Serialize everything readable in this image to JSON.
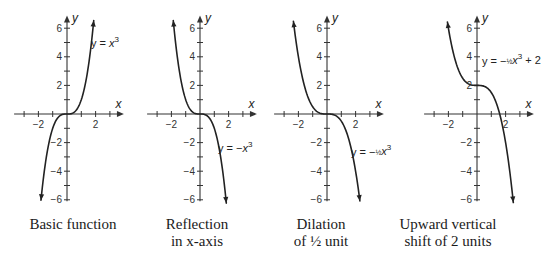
{
  "colors": {
    "curve": "#222222",
    "axis": "#333333",
    "background": "#ffffff"
  },
  "chart_data": [
    {
      "type": "line",
      "title": "Basic function",
      "caption": [
        "Basic function"
      ],
      "equation": "y = x^3",
      "equation_parts": {
        "lhs": "y = ",
        "coef": "",
        "var": "x",
        "exp": "3",
        "tail": ""
      },
      "function": {
        "a": 1,
        "k": 0
      },
      "xlabel": "x",
      "ylabel": "y",
      "xlim": [
        -3,
        3
      ],
      "ylim": [
        -6,
        6
      ],
      "x_tick_labels": [
        "-2",
        "2"
      ],
      "y_tick_labels": [
        "6",
        "4",
        "2",
        "-2",
        "-4",
        "-6"
      ],
      "x": [
        -1.82,
        -1.5,
        -1,
        -0.5,
        0,
        0.5,
        1,
        1.5,
        1.87
      ],
      "y": [
        -6.0,
        -3.38,
        -1,
        -0.13,
        0,
        0.13,
        1,
        3.38,
        6.5
      ]
    },
    {
      "type": "line",
      "title": "Reflection in x-axis",
      "caption": [
        "Reflection",
        "in x-axis"
      ],
      "equation": "y = -x^3",
      "equation_parts": {
        "lhs": "y = −",
        "coef": "",
        "var": "x",
        "exp": "3",
        "tail": ""
      },
      "function": {
        "a": -1,
        "k": 0
      },
      "xlabel": "x",
      "ylabel": "y",
      "xlim": [
        -3,
        3
      ],
      "ylim": [
        -6,
        6
      ],
      "x_tick_labels": [
        "-2",
        "2"
      ],
      "y_tick_labels": [
        "6",
        "4",
        "2",
        "-2",
        "-4",
        "-6"
      ],
      "x": [
        -1.87,
        -1.5,
        -1,
        -0.5,
        0,
        0.5,
        1,
        1.5,
        1.84
      ],
      "y": [
        6.5,
        3.38,
        1,
        0.13,
        0,
        -0.13,
        -1,
        -3.38,
        -6.2
      ]
    },
    {
      "type": "line",
      "title": "Dilation of 1/2 unit",
      "caption": [
        "Dilation",
        "of ½ unit"
      ],
      "equation": "y = -(1/2)x^3",
      "equation_parts": {
        "lhs": "y = −",
        "coef": "½",
        "var": "x",
        "exp": "3",
        "tail": ""
      },
      "function": {
        "a": -0.5,
        "k": 0
      },
      "xlabel": "x",
      "ylabel": "y",
      "xlim": [
        -3,
        3
      ],
      "ylim": [
        -6,
        6
      ],
      "x_tick_labels": [
        "-2",
        "2"
      ],
      "y_tick_labels": [
        "6",
        "4",
        "2",
        "-2",
        "-4",
        "-6"
      ],
      "x": [
        -2.35,
        -2,
        -1.5,
        -1,
        -0.5,
        0,
        0.5,
        1,
        1.5,
        2,
        2.3
      ],
      "y": [
        6.5,
        4,
        1.69,
        0.5,
        0.06,
        0,
        -0.06,
        -0.5,
        -1.69,
        -4,
        -6.1
      ]
    },
    {
      "type": "line",
      "title": "Upward vertical shift of 2 units",
      "caption": [
        "Upward vertical",
        "shift of 2 units"
      ],
      "equation": "y = -(1/2)x^3 + 2",
      "equation_parts": {
        "lhs": "y = −",
        "coef": "½",
        "var": "x",
        "exp": "3",
        "tail": " + 2"
      },
      "function": {
        "a": -0.5,
        "k": 2
      },
      "xlabel": "x",
      "ylabel": "y",
      "xlim": [
        -3,
        3
      ],
      "ylim": [
        -6,
        6
      ],
      "x_tick_labels": [
        "-2",
        "2"
      ],
      "y_tick_labels": [
        "6",
        "4",
        "2",
        "-2",
        "-4",
        "-6"
      ],
      "x": [
        -2.07,
        -2,
        -1.5,
        -1,
        -0.5,
        0,
        0.5,
        1,
        1.5,
        2,
        2.54
      ],
      "y": [
        6.4,
        6,
        3.69,
        2.5,
        2.06,
        2,
        1.94,
        1.5,
        0.31,
        -2,
        -6.2
      ]
    }
  ]
}
